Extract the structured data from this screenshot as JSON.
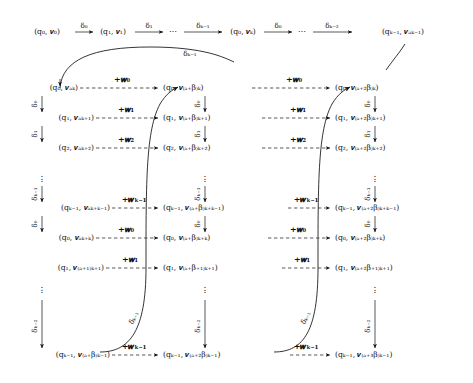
{
  "figure": {
    "type": "commutative-diagram"
  },
  "top_row": {
    "nodes": [
      "(q₀, 𝒗₀)",
      "(q₁, 𝒗₁)",
      "⋯",
      "(q₀, 𝒗ₖ)",
      "⋯",
      "(qₖ₋₁, 𝒗ₐₖ₋₁)"
    ],
    "arrow_labels": [
      "δ₀",
      "δ₁",
      "δₖ₋₁",
      "δ₀",
      "δₖ₋₂"
    ],
    "curve_label": "δₖ₋₁"
  },
  "columns": [
    {
      "name": "column-1",
      "rows": [
        "(q₀, 𝒗ₐₖ)",
        "(q₁, 𝒗ₐₖ₊₁)",
        "(q₂, 𝒗ₐₖ₊₂)",
        "(qₖ₋₁, 𝒗ₐₖ₊ₖ₋₁)",
        "(q₀, 𝒗ₐₖ₊ₖ)",
        "(q₁, 𝒗₍ₐ₊₁₎ₖ₊₁)",
        "(qₖ₋₁, 𝒗₍ₐ₊β₎ₖ₋₁)"
      ]
    },
    {
      "name": "column-2",
      "rows": [
        "(q₀, 𝒗₍ₐ₊β₎ₖ)",
        "(q₁, 𝒗₍ₐ₊β₎ₖ₊₁)",
        "(q₂, 𝒗₍ₐ₊β₎ₖ₊₂)",
        "(qₖ₋₁, 𝒗₍ₐ₊β₎ₖ₊ₖ₋₁)",
        "(q₀, 𝒗₍ₐ₊β₎ₖ₊ₖ)",
        "(q₁, 𝒗₍ₐ₊β₊₁₎ₖ₊₁)",
        "(qₖ₋₁, 𝒗₍ₐ₊₂β₎ₖ₋₁)"
      ]
    },
    {
      "name": "column-3",
      "rows": [
        "(q₀, 𝒗₍ₐ₊₂β₎ₖ)",
        "(q₁, 𝒗₍ₐ₊₂β₎ₖ₊₁)",
        "(q₂, 𝒗₍ₐ₊₂β₎ₖ₊₂)",
        "(qₖ₋₁, 𝒗₍ₐ₊₂β₎ₖ₊ₖ₋₁)",
        "(q₀, 𝒗₍ₐ₊₂β₎ₖ₊ₖ)",
        "(q₁, 𝒗₍ₐ₊₂β₊₁₎ₖ₊₁)",
        "(qₖ₋₁, 𝒗₍ₐ₊₃β₎ₖ₋₁)"
      ]
    }
  ],
  "vertical_labels": [
    "δ₀",
    "δ₁",
    "δₖ₋₁",
    "δ₀",
    "δₖ₋₂"
  ],
  "weight_labels": [
    "+𝒘₀",
    "+𝒘₁",
    "+𝒘₂",
    "+𝒘ₖ₋₁",
    "+𝒘₀",
    "+𝒘₁",
    "+𝒘ₖ₋₁"
  ],
  "curve_labels": [
    "δₖ₋₁",
    "δₖ₋₁"
  ],
  "symbols": {
    "hdots": "⋯",
    "vdots": "⋮",
    "arrowhead": "→"
  },
  "colors": {
    "ink": "#111111",
    "background": "#ffffff"
  }
}
